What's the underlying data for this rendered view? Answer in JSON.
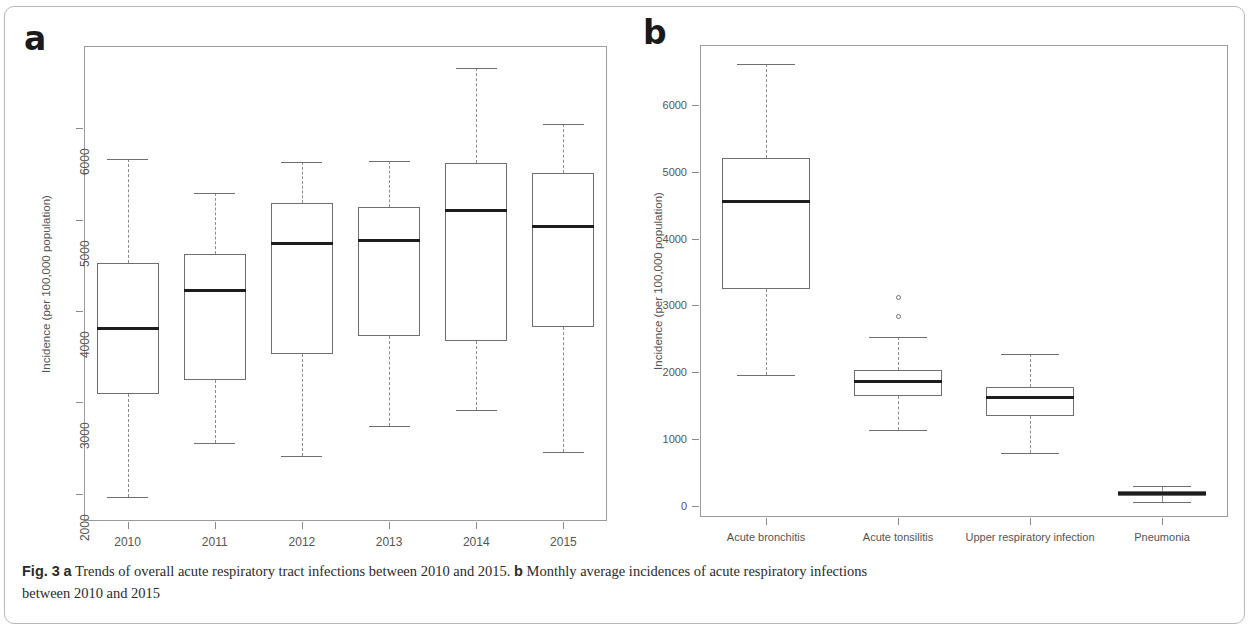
{
  "figure": {
    "caption_prefix": "Fig. 3",
    "caption_a_marker": "a",
    "caption_a_text": " Trends of overall acute respiratory tract infections between 2010 and 2015. ",
    "caption_b_marker": "b",
    "caption_b_text": " Monthly average incidences of acute respiratory infections",
    "caption_line2": "between 2010 and 2015",
    "panel_a_letter": "a",
    "panel_b_letter": "b"
  },
  "chart_data": [
    {
      "type": "box",
      "panel": "a",
      "title": "Trends of overall acute respiratory tract infections between 2010 and 2015",
      "xlabel": "",
      "ylabel": "Incidence (per 100,000 population)",
      "categories": [
        "2010",
        "2011",
        "2012",
        "2013",
        "2014",
        "2015"
      ],
      "ytick_labels": [
        "2000",
        "3000",
        "4000",
        "5000",
        "6000"
      ],
      "ytick_values": [
        2000,
        3000,
        4000,
        5000,
        6000
      ],
      "ylim": [
        1700,
        6900
      ],
      "grid": false,
      "legend": "none",
      "boxes": [
        {
          "category": "2010",
          "whisker_low": 1960,
          "q1": 3090,
          "median": 3810,
          "q3": 4520,
          "whisker_high": 5660,
          "outliers": []
        },
        {
          "category": "2011",
          "whisker_low": 2550,
          "q1": 3240,
          "median": 4220,
          "q3": 4620,
          "whisker_high": 5290,
          "outliers": []
        },
        {
          "category": "2012",
          "whisker_low": 2410,
          "q1": 3530,
          "median": 4740,
          "q3": 5180,
          "whisker_high": 5630,
          "outliers": []
        },
        {
          "category": "2013",
          "whisker_low": 2740,
          "q1": 3720,
          "median": 4770,
          "q3": 5140,
          "whisker_high": 5640,
          "outliers": []
        },
        {
          "category": "2014",
          "whisker_low": 2910,
          "q1": 3670,
          "median": 5100,
          "q3": 5620,
          "whisker_high": 6660,
          "outliers": []
        },
        {
          "category": "2015",
          "whisker_low": 2460,
          "q1": 3820,
          "median": 4920,
          "q3": 5510,
          "whisker_high": 6050,
          "outliers": []
        }
      ]
    },
    {
      "type": "box",
      "panel": "b",
      "title": "Monthly average incidences of acute respiratory infections between 2010 and 2015",
      "xlabel": "",
      "ylabel": "Incidence (per 100,000 population)",
      "categories": [
        "Acute bronchitis",
        "Acute tonsilitis",
        "Upper respiratory infection",
        "Pneumonia"
      ],
      "ytick_labels": [
        "0",
        "1000",
        "2000",
        "3000",
        "4000",
        "5000",
        "6000"
      ],
      "ytick_values": [
        0,
        1000,
        2000,
        3000,
        4000,
        5000,
        6000
      ],
      "ylim": [
        -170,
        6900
      ],
      "grid": false,
      "legend": "none",
      "boxes": [
        {
          "category": "Acute bronchitis",
          "whisker_low": 1960,
          "q1": 3250,
          "median": 4560,
          "q3": 5210,
          "whisker_high": 6620,
          "outliers": []
        },
        {
          "category": "Acute tonsilitis",
          "whisker_low": 1140,
          "q1": 1640,
          "median": 1860,
          "q3": 2030,
          "whisker_high": 2530,
          "outliers": [
            2840,
            3120
          ]
        },
        {
          "category": "Upper respiratory infection",
          "whisker_low": 790,
          "q1": 1350,
          "median": 1620,
          "q3": 1780,
          "whisker_high": 2270,
          "outliers": []
        },
        {
          "category": "Pneumonia",
          "whisker_low": 60,
          "q1": 140,
          "median": 175,
          "q3": 215,
          "whisker_high": 290,
          "outliers": []
        }
      ]
    }
  ],
  "panel_a": {
    "ylabel": "Incidence (per 100,000 population)",
    "yticks": [
      "2000",
      "3000",
      "4000",
      "5000",
      "6000"
    ],
    "xticks": [
      "2010",
      "2011",
      "2012",
      "2013",
      "2014",
      "2015"
    ]
  },
  "panel_b": {
    "ylabel": "Incidence (per 100,000 population)",
    "yticks": [
      "0",
      "1000",
      "2000",
      "3000",
      "4000",
      "5000",
      "6000"
    ],
    "xticks": [
      "Acute bronchitis",
      "Acute tonsilitis",
      "Upper respiratory infection",
      "Pneumonia"
    ]
  }
}
